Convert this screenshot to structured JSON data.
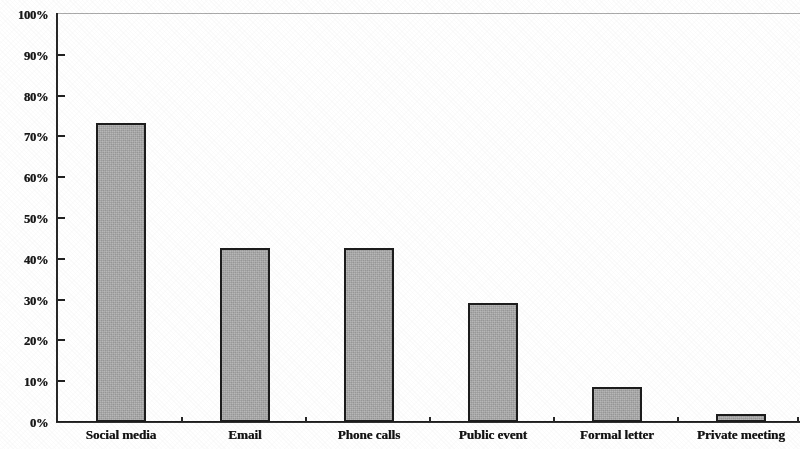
{
  "chart_data": {
    "type": "bar",
    "title": "",
    "subtitle": "",
    "xlabel": "",
    "ylabel": "",
    "categories": [
      "Social media",
      "Email",
      "Phone calls",
      "Public event",
      "Formal letter",
      "Private meeting"
    ],
    "values": [
      73,
      42.5,
      42.5,
      29,
      8.5,
      2
    ],
    "ylim": [
      0,
      100
    ],
    "ytick_labels": [
      "0%",
      "10%",
      "20%",
      "30%",
      "40%",
      "50%",
      "60%",
      "70%",
      "80%",
      "90%",
      "100%"
    ],
    "ytick_values": [
      0,
      10,
      20,
      30,
      40,
      50,
      60,
      70,
      80,
      90,
      100
    ],
    "grid": false,
    "legend": null,
    "legend_position": "none",
    "series": [
      {
        "name": "Percent",
        "values": [
          73,
          42.5,
          42.5,
          29,
          8.5,
          2
        ]
      }
    ],
    "colors": {
      "bar_fill": "#a9a9a9",
      "bar_edge": "#1f1f1f",
      "axis": "#1e1e1e",
      "text": "#151515",
      "background": "#ffffff",
      "top_rule": "#9b9b9b"
    },
    "annotations": []
  }
}
